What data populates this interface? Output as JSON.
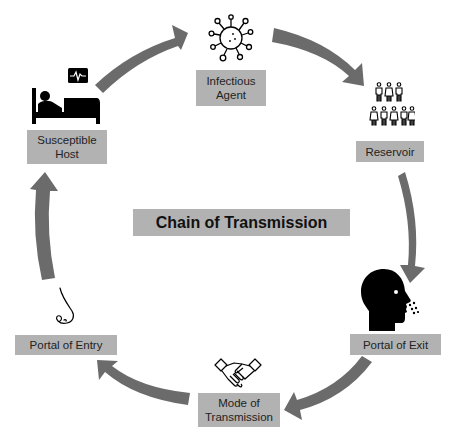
{
  "title": "Chain of Transmission",
  "colors": {
    "arrow": "#6b6b6b",
    "label_bg": "#b2b2b2",
    "label_text": "#222222",
    "icon": "#000000"
  },
  "nodes": [
    {
      "id": "infectious-agent",
      "line1": "Infectious",
      "line2": "Agent",
      "icon": "virus-icon"
    },
    {
      "id": "reservoir",
      "line1": "Reservoir",
      "line2": "",
      "icon": "people-group-icon"
    },
    {
      "id": "portal-of-exit",
      "line1": "Portal of Exit",
      "line2": "",
      "icon": "head-exhale-icon"
    },
    {
      "id": "mode-of-transmission",
      "line1": "Mode of",
      "line2": "Transmission",
      "icon": "handshake-icon"
    },
    {
      "id": "portal-of-entry",
      "line1": "Portal of Entry",
      "line2": "",
      "icon": "nose-icon"
    },
    {
      "id": "susceptible-host",
      "line1": "Susceptible",
      "line2": "Host",
      "icon": "patient-bed-icon"
    }
  ],
  "flow": [
    "Infectious Agent",
    "Reservoir",
    "Portal of Exit",
    "Mode of Transmission",
    "Portal of Entry",
    "Susceptible Host",
    "Infectious Agent"
  ]
}
